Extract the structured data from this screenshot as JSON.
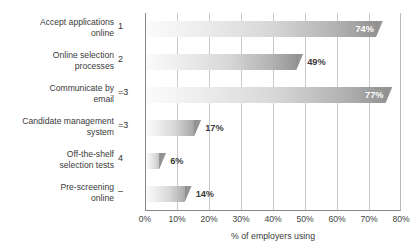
{
  "chart_data": {
    "type": "bar",
    "orientation": "horizontal",
    "title": "",
    "xlabel": "% of employers using",
    "ylabel": "",
    "xlim": [
      0,
      80
    ],
    "xticks": [
      "0%",
      "10%",
      "20%",
      "30%",
      "40%",
      "50%",
      "60%",
      "70%",
      "80%"
    ],
    "xtick_values": [
      0,
      10,
      20,
      30,
      40,
      50,
      60,
      70,
      80
    ],
    "grid": true,
    "legend": false,
    "categories": [
      "Accept applications\nonline",
      "Online selection\nprocesses",
      "Communicate by\nemail",
      "Candidate management\nsystem",
      "Off-the-shelf\nselection tests",
      "Pre-screening\nonline"
    ],
    "values": [
      74,
      49,
      77,
      17,
      6,
      14
    ],
    "value_labels": [
      "74%",
      "49%",
      "77%",
      "17%",
      "6%",
      "14%"
    ],
    "rank_marks": [
      "1",
      "2",
      "=3",
      "=3",
      "4",
      "–"
    ],
    "label_placement": [
      "inside",
      "outside",
      "inside",
      "outside",
      "outside",
      "outside"
    ],
    "colors": {
      "bar_gradient_start": "#fbfbfb",
      "bar_gradient_end": "#8f8f8f",
      "gridline": "#c9c9c9",
      "axis": "#8a8a8a",
      "label_inside": "#ffffff",
      "label_outside": "#3a3a3a",
      "text": "#3a3a3a"
    }
  }
}
